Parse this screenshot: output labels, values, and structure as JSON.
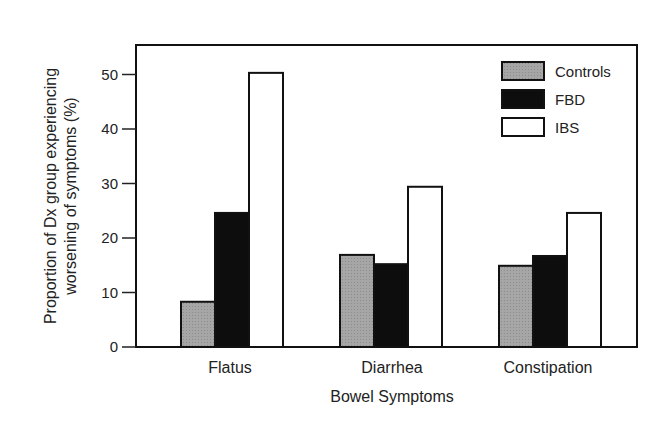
{
  "chart_data": {
    "type": "bar",
    "title": "",
    "xlabel": "Bowel Symptoms",
    "ylabel_lines": [
      "Proportion of Dx group experiencing",
      "worsening of symptoms (%)"
    ],
    "ylabel": "Proportion of Dx group experiencing worsening of symptoms (%)",
    "categories": [
      "Flatus",
      "Diarrhea",
      "Constipation"
    ],
    "series": [
      {
        "name": "Controls",
        "values": [
          8.3,
          16.9,
          14.9
        ],
        "color": "#a6a6a6"
      },
      {
        "name": "FBD",
        "values": [
          24.6,
          15.2,
          16.7
        ],
        "color": "#0d0d0d"
      },
      {
        "name": "IBS",
        "values": [
          50.3,
          29.4,
          24.6
        ],
        "color": "#ffffff"
      }
    ],
    "ylim": [
      0,
      55
    ],
    "yticks": [
      0,
      10,
      20,
      30,
      40,
      50
    ],
    "grid": false,
    "legend_position": "upper right"
  }
}
